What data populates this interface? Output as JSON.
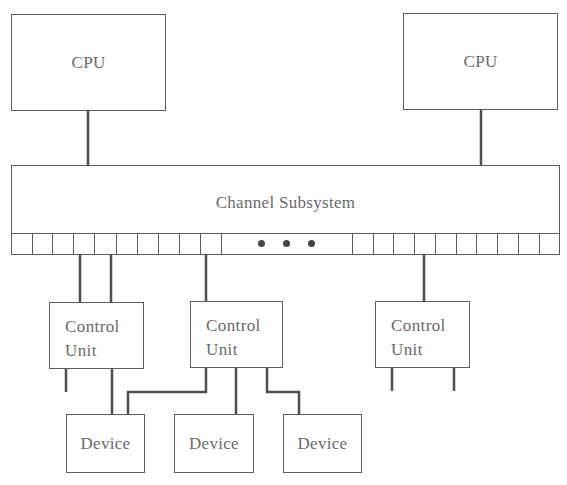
{
  "diagram": {
    "cpus": [
      {
        "label": "CPU"
      },
      {
        "label": "CPU"
      }
    ],
    "channel_subsystem": {
      "label": "Channel Subsystem",
      "left_subchannel_count": 10,
      "right_subchannel_count": 10,
      "ellipsis": "• • •"
    },
    "control_units": [
      {
        "line1": "Control",
        "line2": "Unit"
      },
      {
        "line1": "Control",
        "line2": "Unit"
      },
      {
        "line1": "Control",
        "line2": "Unit"
      }
    ],
    "devices": [
      {
        "label": "Device"
      },
      {
        "label": "Device"
      },
      {
        "label": "Device"
      }
    ],
    "colors": {
      "line": "#5c5c5c",
      "text": "#6a6a6a",
      "background": "#ffffff"
    }
  }
}
